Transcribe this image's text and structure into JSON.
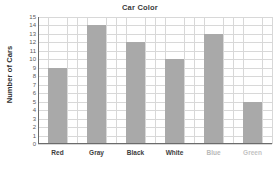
{
  "chart_data": {
    "type": "bar",
    "title": "Car Color",
    "xlabel": "",
    "ylabel": "Number of Cars",
    "categories": [
      "Red",
      "Gray",
      "Black",
      "White",
      "Blue",
      "Green"
    ],
    "values": [
      9,
      14,
      12,
      10,
      13,
      5
    ],
    "ylim": [
      0,
      15
    ],
    "ytick_labels": [
      "15",
      "14",
      "13",
      "12",
      "11",
      "10",
      "9",
      "8",
      "7",
      "6",
      "5",
      "4",
      "3",
      "2",
      "1",
      "0"
    ],
    "ytick_values": [
      15,
      14,
      13,
      12,
      11,
      10,
      9,
      8,
      7,
      6,
      5,
      4,
      3,
      2,
      1,
      0
    ],
    "grid": true,
    "legend": "none",
    "bar_color": "#a9a9a9",
    "grid_color": "#d8d8d8",
    "axis_color": "#6b6b6b",
    "label_colors": [
      "#3d3d3d",
      "#3d3d3d",
      "#3d3d3d",
      "#3d3d3d",
      "#b9b9b9",
      "#c3c3c3"
    ],
    "title_color": "#3a3a3a",
    "ylabel_color": "#2d2d2d",
    "background": "#ffffff"
  }
}
